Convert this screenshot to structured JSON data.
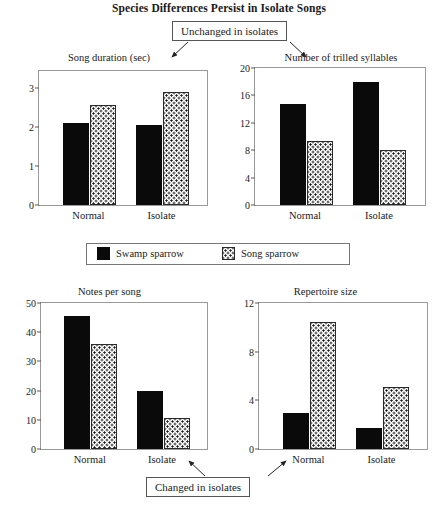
{
  "title": "Species Differences Persist in Isolate Songs",
  "annotations": {
    "top": "Unchanged in isolates",
    "bottom": "Changed in isolates"
  },
  "legend": {
    "items": [
      {
        "label": "Swamp sparrow",
        "fill": "solid",
        "color": "#0a0a0a"
      },
      {
        "label": "Song sparrow",
        "fill": "dotted",
        "color": "#ffffff"
      }
    ]
  },
  "chart_data": [
    {
      "id": "song-duration",
      "type": "bar",
      "title": "Song duration (sec)",
      "xlabel": "",
      "ylabel": "",
      "categories": [
        "Normal",
        "Isolate"
      ],
      "yticks": [
        0,
        1,
        2,
        3
      ],
      "ylim": [
        0,
        3.45
      ],
      "grid": false,
      "legend_position": "external-center",
      "series": [
        {
          "name": "Swamp sparrow",
          "values": [
            2.1,
            2.05
          ]
        },
        {
          "name": "Song sparrow",
          "values": [
            2.58,
            2.9
          ]
        }
      ]
    },
    {
      "id": "trilled-syllables",
      "type": "bar",
      "title": "Number of  trilled syllables",
      "xlabel": "",
      "ylabel": "",
      "categories": [
        "Normal",
        "Isolate"
      ],
      "yticks": [
        0,
        4,
        8,
        12,
        16,
        20
      ],
      "ylim": [
        0,
        20
      ],
      "grid": false,
      "legend_position": "external-center",
      "series": [
        {
          "name": "Swamp sparrow",
          "values": [
            14.8,
            17.9
          ]
        },
        {
          "name": "Song sparrow",
          "values": [
            9.4,
            8.0
          ]
        }
      ]
    },
    {
      "id": "notes-per-song",
      "type": "bar",
      "title": "Notes per song",
      "xlabel": "",
      "ylabel": "",
      "categories": [
        "Normal",
        "Isolate"
      ],
      "yticks": [
        0,
        10,
        20,
        30,
        40,
        50
      ],
      "ylim": [
        0,
        50
      ],
      "grid": false,
      "legend_position": "external-center",
      "series": [
        {
          "name": "Swamp sparrow",
          "values": [
            45.5,
            20.0
          ]
        },
        {
          "name": "Song sparrow",
          "values": [
            36.0,
            10.5
          ]
        }
      ]
    },
    {
      "id": "repertoire-size",
      "type": "bar",
      "title": "Repertoire size",
      "xlabel": "",
      "ylabel": "",
      "categories": [
        "Normal",
        "Isolate"
      ],
      "yticks": [
        0,
        4,
        8,
        12
      ],
      "ylim": [
        0,
        12
      ],
      "grid": false,
      "legend_position": "external-center",
      "series": [
        {
          "name": "Swamp sparrow",
          "values": [
            3.0,
            1.7
          ]
        },
        {
          "name": "Song sparrow",
          "values": [
            10.4,
            5.1
          ]
        }
      ]
    }
  ]
}
